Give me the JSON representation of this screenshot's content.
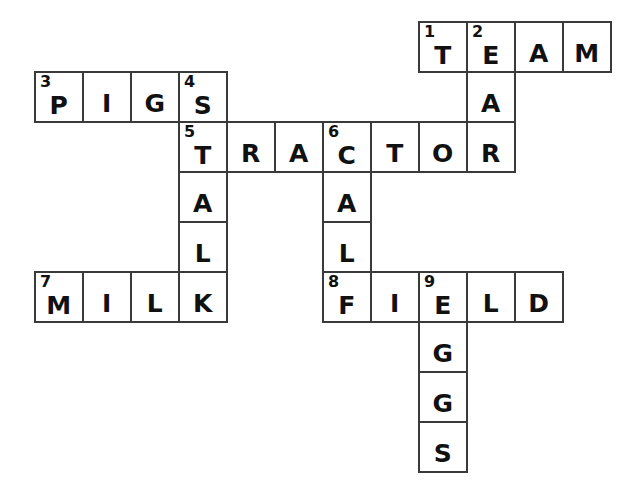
{
  "puzzle": {
    "title": "Farm Crossword Puzzle",
    "type": "crossword-grid",
    "grid": {
      "origin_x": 34,
      "origin_y": 21,
      "cell_width": 48,
      "cell_height": 50,
      "columns": 12,
      "rows": 9,
      "border_color": "#3a3a3a",
      "cell_fill": "#ffffff",
      "text_color": "#111111",
      "background": "#ffffff"
    },
    "entries": [
      {
        "number": "1",
        "answer": "TEAM",
        "direction": "across",
        "row": 0,
        "col": 8
      },
      {
        "number": "2",
        "answer": "EAR",
        "direction": "down",
        "row": 0,
        "col": 9
      },
      {
        "number": "3",
        "answer": "PIGS",
        "direction": "across",
        "row": 1,
        "col": 0
      },
      {
        "number": "4",
        "answer": "STALK",
        "direction": "down",
        "row": 1,
        "col": 3
      },
      {
        "number": "5",
        "answer": "TRACTOR",
        "direction": "across",
        "row": 2,
        "col": 3
      },
      {
        "number": "6",
        "answer": "CALF",
        "direction": "down",
        "row": 2,
        "col": 6
      },
      {
        "number": "7",
        "answer": "MILK",
        "direction": "across",
        "row": 5,
        "col": 0
      },
      {
        "number": "8",
        "answer": "FIELD",
        "direction": "across",
        "row": 5,
        "col": 6
      },
      {
        "number": "9",
        "answer": "EGGS",
        "direction": "down",
        "row": 5,
        "col": 8
      }
    ],
    "cells": [
      {
        "row": 0,
        "col": 8,
        "letter": "T",
        "number": "1"
      },
      {
        "row": 0,
        "col": 9,
        "letter": "E",
        "number": "2"
      },
      {
        "row": 0,
        "col": 10,
        "letter": "A",
        "number": ""
      },
      {
        "row": 0,
        "col": 11,
        "letter": "M",
        "number": ""
      },
      {
        "row": 1,
        "col": 0,
        "letter": "P",
        "number": "3"
      },
      {
        "row": 1,
        "col": 1,
        "letter": "I",
        "number": ""
      },
      {
        "row": 1,
        "col": 2,
        "letter": "G",
        "number": ""
      },
      {
        "row": 1,
        "col": 3,
        "letter": "S",
        "number": "4"
      },
      {
        "row": 1,
        "col": 9,
        "letter": "A",
        "number": ""
      },
      {
        "row": 2,
        "col": 3,
        "letter": "T",
        "number": "5"
      },
      {
        "row": 2,
        "col": 4,
        "letter": "R",
        "number": ""
      },
      {
        "row": 2,
        "col": 5,
        "letter": "A",
        "number": ""
      },
      {
        "row": 2,
        "col": 6,
        "letter": "C",
        "number": "6"
      },
      {
        "row": 2,
        "col": 7,
        "letter": "T",
        "number": ""
      },
      {
        "row": 2,
        "col": 8,
        "letter": "O",
        "number": ""
      },
      {
        "row": 2,
        "col": 9,
        "letter": "R",
        "number": ""
      },
      {
        "row": 3,
        "col": 3,
        "letter": "A",
        "number": ""
      },
      {
        "row": 3,
        "col": 6,
        "letter": "A",
        "number": ""
      },
      {
        "row": 4,
        "col": 3,
        "letter": "L",
        "number": ""
      },
      {
        "row": 4,
        "col": 6,
        "letter": "L",
        "number": ""
      },
      {
        "row": 5,
        "col": 0,
        "letter": "M",
        "number": "7"
      },
      {
        "row": 5,
        "col": 1,
        "letter": "I",
        "number": ""
      },
      {
        "row": 5,
        "col": 2,
        "letter": "L",
        "number": ""
      },
      {
        "row": 5,
        "col": 3,
        "letter": "K",
        "number": ""
      },
      {
        "row": 5,
        "col": 6,
        "letter": "F",
        "number": "8"
      },
      {
        "row": 5,
        "col": 7,
        "letter": "I",
        "number": ""
      },
      {
        "row": 5,
        "col": 8,
        "letter": "E",
        "number": "9"
      },
      {
        "row": 5,
        "col": 9,
        "letter": "L",
        "number": ""
      },
      {
        "row": 5,
        "col": 10,
        "letter": "D",
        "number": ""
      },
      {
        "row": 6,
        "col": 8,
        "letter": "G",
        "number": ""
      },
      {
        "row": 7,
        "col": 8,
        "letter": "G",
        "number": ""
      },
      {
        "row": 8,
        "col": 8,
        "letter": "S",
        "number": ""
      }
    ]
  }
}
